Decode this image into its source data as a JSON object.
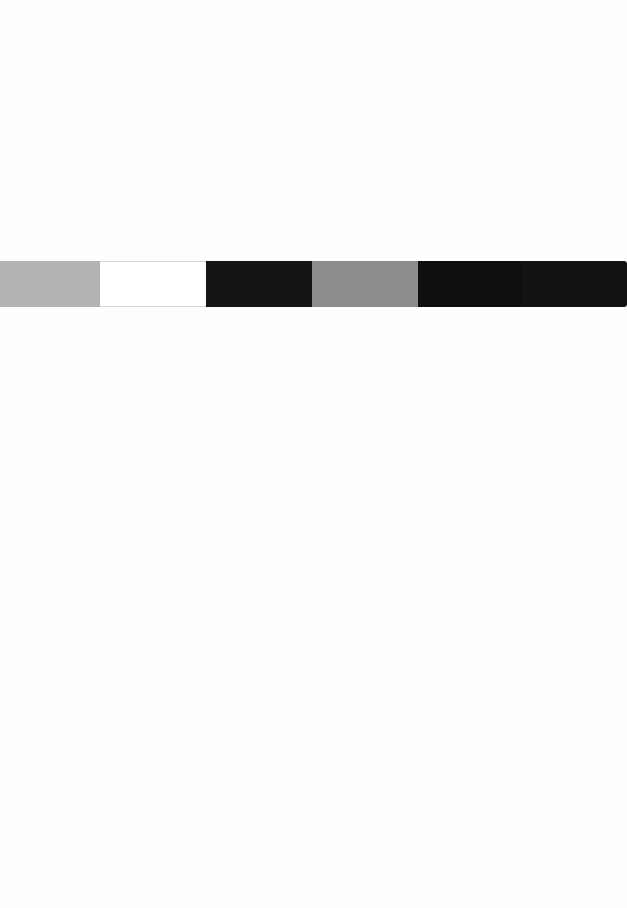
{
  "page": {
    "background": "#fefefe",
    "width": 627,
    "height": 908
  },
  "swatch_strip": {
    "top": 261,
    "height": 46,
    "swatches": [
      {
        "name": "light-gray",
        "color": "#b4b4b4",
        "width": 100
      },
      {
        "name": "white",
        "color": "#ffffff",
        "width": 106
      },
      {
        "name": "black-1",
        "color": "#141414",
        "width": 106
      },
      {
        "name": "medium-gray",
        "color": "#8c8c8c",
        "width": 106
      },
      {
        "name": "black-2",
        "color": "#0f0f0f",
        "width": 104
      },
      {
        "name": "black-3",
        "color": "#121212",
        "width": 105
      }
    ]
  }
}
